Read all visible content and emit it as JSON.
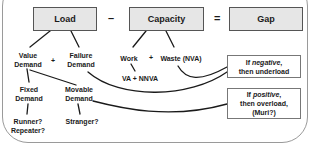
{
  "equation": {
    "load": "Load",
    "minus": "–",
    "capacity": "Capacity",
    "equals": "=",
    "gap": "Gap"
  },
  "load_breakdown": {
    "value_demand": [
      "Value",
      "Demand"
    ],
    "plus": "+",
    "failure_demand": [
      "Failure",
      "Demand"
    ],
    "fixed_demand": [
      "Fixed",
      "Demand"
    ],
    "movable_demand": [
      "Movable",
      "Demand"
    ],
    "fixed_examples": [
      "Runner?",
      "Repeater?"
    ],
    "movable_examples": "Stranger?"
  },
  "capacity_breakdown": {
    "work": "Work",
    "plus": "+",
    "waste": "Waste (NVA)",
    "work_detail": "VA + NNVA"
  },
  "gap_outcomes": {
    "negative": {
      "prefix": "If ",
      "keyword": "negative",
      "suffix": ",",
      "line2": "then underload"
    },
    "positive": {
      "prefix": "If ",
      "keyword": "positive",
      "suffix": ",",
      "line2": "then overload,",
      "line3": "(Muri?)"
    }
  },
  "colors": {
    "box_fill": "#e6e6e6",
    "box_border": "#555555",
    "line": "#1a1a1a",
    "frame": "#9a9a9a"
  }
}
